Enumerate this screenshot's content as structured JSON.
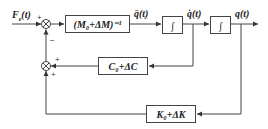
{
  "diagram": {
    "type": "control-block-diagram",
    "input": {
      "label": "F_e(t)",
      "text": "F",
      "sub": "e",
      "arg": "(t)"
    },
    "summers": [
      {
        "id": "sum-top",
        "signs": {
          "left": "+",
          "bottom": "−"
        }
      },
      {
        "id": "sum-bottom",
        "signs": {
          "right": "+",
          "bottom": "+"
        }
      }
    ],
    "blocks": [
      {
        "id": "mass-inverse",
        "label": "(M₀+ΔM)⁻¹"
      },
      {
        "id": "integrator-1",
        "label": "∫"
      },
      {
        "id": "integrator-2",
        "label": "∫"
      },
      {
        "id": "damping",
        "label": "C₀+ΔC"
      },
      {
        "id": "stiffness",
        "label": "K₀+ΔK"
      }
    ],
    "signals": {
      "acceleration": "q̈(t)",
      "velocity": "q̇(t)",
      "position": "q(t)"
    },
    "edges": [
      {
        "from": "input",
        "to": "sum-top"
      },
      {
        "from": "sum-top",
        "to": "mass-inverse"
      },
      {
        "from": "mass-inverse",
        "to": "integrator-1",
        "label": "q̈(t)"
      },
      {
        "from": "integrator-1",
        "to": "integrator-2",
        "label": "q̇(t)"
      },
      {
        "from": "integrator-2",
        "to": "output",
        "label": "q(t)"
      },
      {
        "from": "velocity-node",
        "to": "damping"
      },
      {
        "from": "damping",
        "to": "sum-bottom"
      },
      {
        "from": "position-node",
        "to": "stiffness"
      },
      {
        "from": "stiffness",
        "to": "sum-bottom"
      },
      {
        "from": "sum-bottom",
        "to": "sum-top"
      }
    ]
  }
}
